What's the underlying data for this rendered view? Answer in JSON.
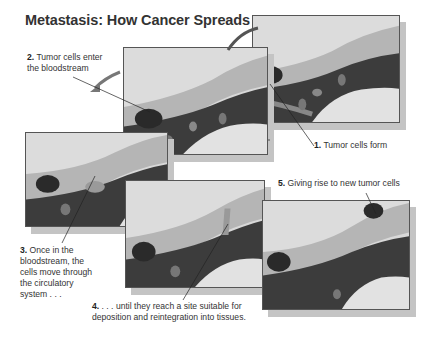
{
  "title": "Metastasis: How Cancer Spreads",
  "steps": [
    {
      "num": "1.",
      "text": "Tumor cells form"
    },
    {
      "num": "2.",
      "text": "Tumor cells enter the bloodstream",
      "line1": "Tumor cells enter",
      "line2": "the bloodstream"
    },
    {
      "num": "3.",
      "text": "Once in the bloodstream, the cells move through the circulatory system . . .",
      "line1": "Once in the",
      "line2": "bloodstream, the",
      "line3": "cells move through",
      "line4": "the circulatory",
      "line5": "system . . ."
    },
    {
      "num": "4.",
      "text": ". . . until they reach a site suitable for deposition and reintegration into tissues.",
      "line1": ". . . until they reach a site suitable for",
      "line2": "deposition and reintegration into tissues."
    },
    {
      "num": "5.",
      "text": "Giving rise to new tumor cells"
    }
  ],
  "colors": {
    "panel_bg": "#d8d8d8",
    "vessel_dark": "#3a3a3a",
    "tissue": "#b8b8b8",
    "tumor": "#2e2e2e"
  }
}
